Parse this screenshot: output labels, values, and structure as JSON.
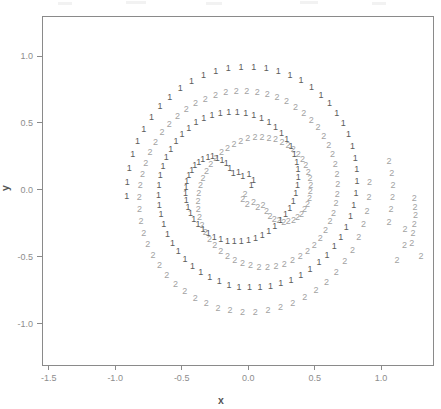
{
  "figure": {
    "kind": "scatter-plot",
    "background": "#ffffff",
    "width": 441,
    "height": 409,
    "plot_box": {
      "left": 42,
      "top": 16,
      "right": 433,
      "bottom": 365
    }
  },
  "chart_data": {
    "type": "scatter",
    "title": "",
    "subtitle": "",
    "xlabel": "x",
    "ylabel": "y",
    "xlim": [
      -1.55,
      1.39
    ],
    "ylim": [
      -1.31,
      1.3
    ],
    "xticks": [
      -1.5,
      -1.0,
      -0.5,
      0.0,
      0.5,
      1.0
    ],
    "xticklabels": [
      "-1.5",
      "-1.0",
      "-0.5",
      "0.0",
      "0.5",
      "1.0"
    ],
    "yticks": [
      -1.0,
      -0.5,
      0.0,
      0.5,
      1.0
    ],
    "yticklabels": [
      "-1.0",
      "-0.5",
      "0.0",
      "0.5",
      "1.0"
    ],
    "grid": false,
    "legend": null,
    "marker_style": "text-glyph",
    "colors": {
      "class1": "#5b5b5b",
      "class2": "#a2a2a2",
      "axis": "#8a8a8a",
      "text": "#8d8d8d"
    },
    "series": [
      {
        "name": "1",
        "label_glyph": "1",
        "color": "#5b5b5b",
        "n": 97,
        "points": [
          [
            0.023,
            0.034
          ],
          [
            0.041,
            0.072
          ],
          [
            0.006,
            0.112
          ],
          [
            -0.041,
            0.096
          ],
          [
            -0.072,
            0.132
          ],
          [
            -0.112,
            0.121
          ],
          [
            -0.138,
            0.162
          ],
          [
            -0.164,
            0.198
          ],
          [
            -0.197,
            0.221
          ],
          [
            -0.232,
            0.232
          ],
          [
            -0.268,
            0.246
          ],
          [
            -0.302,
            0.238
          ],
          [
            -0.341,
            0.228
          ],
          [
            -0.372,
            0.206
          ],
          [
            -0.402,
            0.182
          ],
          [
            -0.423,
            0.147
          ],
          [
            -0.446,
            0.108
          ],
          [
            -0.461,
            0.065
          ],
          [
            -0.468,
            0.017
          ],
          [
            -0.47,
            -0.031
          ],
          [
            -0.465,
            -0.082
          ],
          [
            -0.452,
            -0.131
          ],
          [
            -0.434,
            -0.178
          ],
          [
            -0.408,
            -0.223
          ],
          [
            -0.376,
            -0.263
          ],
          [
            -0.34,
            -0.299
          ],
          [
            -0.299,
            -0.33
          ],
          [
            -0.254,
            -0.355
          ],
          [
            -0.206,
            -0.374
          ],
          [
            -0.156,
            -0.386
          ],
          [
            -0.104,
            -0.391
          ],
          [
            -0.051,
            -0.389
          ],
          [
            0.002,
            -0.38
          ],
          [
            0.055,
            -0.364
          ],
          [
            0.106,
            -0.341
          ],
          [
            0.155,
            -0.311
          ],
          [
            0.201,
            -0.275
          ],
          [
            0.243,
            -0.234
          ],
          [
            0.281,
            -0.188
          ],
          [
            0.313,
            -0.138
          ],
          [
            0.339,
            -0.085
          ],
          [
            0.359,
            -0.029
          ],
          [
            0.372,
            0.029
          ],
          [
            0.377,
            0.088
          ],
          [
            0.375,
            0.148
          ],
          [
            0.365,
            0.207
          ],
          [
            0.347,
            0.265
          ],
          [
            0.322,
            0.32
          ],
          [
            0.29,
            0.372
          ],
          [
            0.251,
            0.419
          ],
          [
            0.206,
            0.462
          ],
          [
            0.156,
            0.499
          ],
          [
            0.101,
            0.53
          ],
          [
            0.043,
            0.554
          ],
          [
            -0.018,
            0.57
          ],
          [
            -0.081,
            0.579
          ],
          [
            -0.145,
            0.58
          ],
          [
            -0.209,
            0.572
          ],
          [
            -0.272,
            0.556
          ],
          [
            -0.333,
            0.532
          ],
          [
            -0.392,
            0.5
          ],
          [
            -0.447,
            0.461
          ],
          [
            -0.497,
            0.415
          ],
          [
            -0.543,
            0.362
          ],
          [
            -0.582,
            0.304
          ],
          [
            -0.615,
            0.241
          ],
          [
            -0.641,
            0.175
          ],
          [
            -0.66,
            0.105
          ],
          [
            -0.671,
            0.033
          ],
          [
            -0.674,
            -0.04
          ],
          [
            -0.669,
            -0.115
          ],
          [
            -0.656,
            -0.189
          ],
          [
            -0.635,
            -0.262
          ],
          [
            -0.606,
            -0.332
          ],
          [
            -0.569,
            -0.399
          ],
          [
            -0.525,
            -0.462
          ],
          [
            -0.475,
            -0.52
          ],
          [
            -0.418,
            -0.572
          ],
          [
            -0.356,
            -0.618
          ],
          [
            -0.289,
            -0.657
          ],
          [
            -0.218,
            -0.689
          ],
          [
            -0.144,
            -0.713
          ],
          [
            -0.068,
            -0.728
          ],
          [
            0.01,
            -0.735
          ],
          [
            0.089,
            -0.734
          ],
          [
            0.168,
            -0.724
          ],
          [
            0.246,
            -0.705
          ],
          [
            0.322,
            -0.678
          ],
          [
            0.396,
            -0.643
          ],
          [
            0.466,
            -0.599
          ],
          [
            0.532,
            -0.548
          ],
          [
            0.593,
            -0.49
          ],
          [
            0.648,
            -0.425
          ],
          [
            0.696,
            -0.355
          ],
          [
            0.737,
            -0.279
          ],
          [
            0.77,
            -0.199
          ],
          [
            0.795,
            -0.115
          ],
          [
            0.811,
            -0.029
          ],
          [
            0.818,
            0.059
          ],
          [
            0.816,
            0.148
          ],
          [
            0.805,
            0.237
          ],
          [
            0.784,
            0.325
          ],
          [
            0.754,
            0.41
          ],
          [
            0.715,
            0.492
          ],
          [
            0.667,
            0.569
          ],
          [
            0.611,
            0.641
          ],
          [
            0.547,
            0.706
          ],
          [
            0.476,
            0.764
          ],
          [
            0.398,
            0.813
          ],
          [
            0.315,
            0.854
          ],
          [
            0.227,
            0.885
          ],
          [
            0.136,
            0.906
          ],
          [
            0.042,
            0.917
          ],
          [
            -0.053,
            0.917
          ],
          [
            -0.149,
            0.906
          ],
          [
            -0.243,
            0.884
          ],
          [
            -0.336,
            0.852
          ],
          [
            -0.425,
            0.808
          ],
          [
            -0.51,
            0.755
          ],
          [
            -0.589,
            0.692
          ],
          [
            -0.662,
            0.62
          ],
          [
            -0.727,
            0.54
          ],
          [
            -0.784,
            0.453
          ],
          [
            -0.831,
            0.36
          ],
          [
            -0.868,
            0.262
          ],
          [
            -0.894,
            0.16
          ],
          [
            -0.909,
            0.055
          ],
          [
            -0.913,
            -0.051
          ]
        ]
      },
      {
        "name": "2",
        "label_glyph": "2",
        "color": "#a2a2a2",
        "n": 97,
        "points": [
          [
            -0.023,
            -0.034
          ],
          [
            -0.041,
            -0.072
          ],
          [
            -0.006,
            -0.112
          ],
          [
            0.041,
            -0.096
          ],
          [
            0.072,
            -0.132
          ],
          [
            0.112,
            -0.121
          ],
          [
            0.138,
            -0.162
          ],
          [
            0.164,
            -0.198
          ],
          [
            0.197,
            -0.221
          ],
          [
            0.232,
            -0.232
          ],
          [
            0.268,
            -0.246
          ],
          [
            0.302,
            -0.238
          ],
          [
            0.341,
            -0.228
          ],
          [
            0.372,
            -0.206
          ],
          [
            0.402,
            -0.182
          ],
          [
            0.423,
            -0.147
          ],
          [
            0.446,
            -0.108
          ],
          [
            0.461,
            -0.065
          ],
          [
            0.468,
            -0.017
          ],
          [
            0.47,
            0.031
          ],
          [
            0.465,
            0.082
          ],
          [
            0.452,
            0.131
          ],
          [
            0.434,
            0.178
          ],
          [
            0.408,
            0.223
          ],
          [
            0.376,
            0.263
          ],
          [
            0.34,
            0.299
          ],
          [
            0.299,
            0.33
          ],
          [
            0.254,
            0.355
          ],
          [
            0.206,
            0.374
          ],
          [
            0.156,
            0.386
          ],
          [
            0.104,
            0.391
          ],
          [
            0.051,
            0.389
          ],
          [
            -0.002,
            0.38
          ],
          [
            -0.055,
            0.364
          ],
          [
            -0.106,
            0.341
          ],
          [
            -0.155,
            0.311
          ],
          [
            -0.201,
            0.275
          ],
          [
            -0.243,
            0.234
          ],
          [
            -0.281,
            0.188
          ],
          [
            -0.313,
            0.138
          ],
          [
            -0.339,
            0.085
          ],
          [
            -0.359,
            0.029
          ],
          [
            -0.372,
            -0.029
          ],
          [
            -0.377,
            -0.088
          ],
          [
            -0.375,
            -0.148
          ],
          [
            -0.365,
            -0.207
          ],
          [
            -0.347,
            -0.265
          ],
          [
            -0.322,
            -0.32
          ],
          [
            -0.29,
            -0.372
          ],
          [
            -0.251,
            -0.419
          ],
          [
            -0.206,
            -0.462
          ],
          [
            -0.156,
            -0.499
          ],
          [
            -0.101,
            -0.53
          ],
          [
            -0.043,
            -0.554
          ],
          [
            0.018,
            -0.57
          ],
          [
            0.081,
            -0.579
          ],
          [
            0.145,
            -0.58
          ],
          [
            0.209,
            -0.572
          ],
          [
            0.272,
            -0.556
          ],
          [
            0.333,
            -0.532
          ],
          [
            0.392,
            -0.5
          ],
          [
            0.447,
            -0.461
          ],
          [
            0.497,
            -0.415
          ],
          [
            0.543,
            -0.362
          ],
          [
            0.582,
            -0.304
          ],
          [
            0.615,
            -0.241
          ],
          [
            0.641,
            -0.175
          ],
          [
            0.66,
            -0.105
          ],
          [
            0.671,
            -0.033
          ],
          [
            0.674,
            0.04
          ],
          [
            0.669,
            0.115
          ],
          [
            0.656,
            0.189
          ],
          [
            0.635,
            0.262
          ],
          [
            0.606,
            0.332
          ],
          [
            0.569,
            0.399
          ],
          [
            0.525,
            0.462
          ],
          [
            0.475,
            0.52
          ],
          [
            0.418,
            0.572
          ],
          [
            0.356,
            0.618
          ],
          [
            0.289,
            0.657
          ],
          [
            0.218,
            0.689
          ],
          [
            0.144,
            0.713
          ],
          [
            0.068,
            0.728
          ],
          [
            -0.01,
            0.735
          ],
          [
            -0.089,
            0.734
          ],
          [
            -0.168,
            0.724
          ],
          [
            -0.246,
            0.705
          ],
          [
            -0.322,
            0.678
          ],
          [
            -0.396,
            0.643
          ],
          [
            -0.466,
            0.599
          ],
          [
            -0.532,
            0.548
          ],
          [
            -0.593,
            0.49
          ],
          [
            -0.648,
            0.425
          ],
          [
            -0.696,
            0.355
          ],
          [
            -0.737,
            0.279
          ],
          [
            -0.77,
            0.199
          ],
          [
            -0.795,
            0.115
          ],
          [
            -0.811,
            0.029
          ],
          [
            -0.818,
            -0.059
          ],
          [
            -0.816,
            -0.148
          ],
          [
            -0.805,
            -0.237
          ],
          [
            -0.784,
            -0.325
          ],
          [
            -0.754,
            -0.41
          ],
          [
            -0.715,
            -0.492
          ],
          [
            -0.667,
            -0.569
          ],
          [
            -0.611,
            -0.641
          ],
          [
            -0.547,
            -0.706
          ],
          [
            -0.476,
            -0.764
          ],
          [
            -0.398,
            -0.813
          ],
          [
            -0.315,
            -0.854
          ],
          [
            -0.227,
            -0.885
          ],
          [
            -0.136,
            -0.906
          ],
          [
            -0.042,
            -0.917
          ],
          [
            0.053,
            -0.917
          ],
          [
            0.149,
            -0.906
          ],
          [
            0.243,
            -0.884
          ],
          [
            0.336,
            -0.852
          ],
          [
            0.425,
            -0.808
          ],
          [
            0.51,
            -0.755
          ],
          [
            0.589,
            -0.692
          ],
          [
            0.662,
            -0.62
          ],
          [
            0.727,
            -0.54
          ],
          [
            0.784,
            -0.453
          ],
          [
            0.831,
            -0.36
          ],
          [
            0.868,
            -0.262
          ],
          [
            0.894,
            -0.16
          ],
          [
            0.909,
            -0.055
          ],
          [
            0.913,
            0.051
          ],
          [
            1.06,
            0.21
          ],
          [
            1.08,
            0.12
          ],
          [
            1.09,
            0.03
          ],
          [
            1.085,
            -0.06
          ],
          [
            1.075,
            -0.15
          ],
          [
            1.06,
            -0.245
          ],
          [
            1.18,
            -0.3
          ],
          [
            1.175,
            -0.42
          ],
          [
            1.12,
            -0.53
          ],
          [
            1.25,
            -0.065
          ],
          [
            1.255,
            -0.13
          ],
          [
            1.258,
            -0.195
          ],
          [
            1.25,
            -0.26
          ],
          [
            1.24,
            -0.33
          ],
          [
            1.23,
            -0.4
          ],
          [
            1.3,
            -0.5
          ]
        ]
      }
    ]
  },
  "axes": {
    "x_title": "x",
    "y_title": "y"
  }
}
